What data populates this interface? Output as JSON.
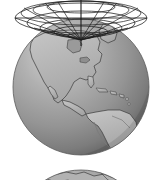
{
  "figure": {
    "background_color": "#ffffff",
    "width": 158,
    "height": 180
  },
  "globe_primary": {
    "name": "Earth globe showing the Americas",
    "center_x": 81,
    "center_y": 87,
    "radius": 68,
    "ocean_color": "#9a9a9a",
    "ocean_highlight_color": "#c8c8c8",
    "ocean_shadow_color": "#6f6f6f",
    "land_color": "#b4b4b4",
    "coastline_color": "#3a3a3a",
    "outline_color": "#555555",
    "visible_regions": [
      "North America",
      "Central America",
      "South America",
      "Greenland",
      "Caribbean",
      "Atlantic Ocean",
      "Pacific Ocean"
    ]
  },
  "globe_secondary": {
    "name": "Second Earth globe, top cap visible at bottom edge",
    "center_x": 81,
    "center_y": 238,
    "radius": 68,
    "ocean_color": "#9a9a9a",
    "land_color": "#b4b4b4",
    "coastline_color": "#3a3a3a",
    "visible_regions": [
      "Europe",
      "Africa",
      "Asia",
      "Middle East"
    ]
  },
  "wireframe_grid": {
    "name": "Polar coordinate wireframe cone above north pole",
    "apex_x": 81,
    "apex_y": 40,
    "line_color": "#1c1c1c",
    "line_width": 0.7,
    "ring_count": 5,
    "radial_count": 12,
    "rings": [
      {
        "rx": 66,
        "ry": 15,
        "cy": 18
      },
      {
        "rx": 54,
        "ry": 12,
        "cy": 23
      },
      {
        "rx": 41,
        "ry": 9,
        "cy": 28
      },
      {
        "rx": 27,
        "ry": 6,
        "cy": 32
      },
      {
        "rx": 13,
        "ry": 3,
        "cy": 36
      }
    ]
  },
  "axis": {
    "name": "Vertical polar axis",
    "x": 81,
    "y_top": 0,
    "y_bottom": 46,
    "color": "#1c1c1c",
    "width": 1.1
  },
  "horizon_line": {
    "name": "Horizontal reference line through grid",
    "y": 18,
    "x_start": 15,
    "x_end": 147,
    "color": "#1c1c1c",
    "width": 0.8
  }
}
